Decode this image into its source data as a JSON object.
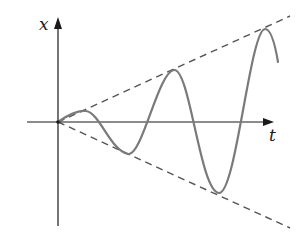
{
  "diagram": {
    "axes": {
      "vertical_label": "x",
      "horizontal_label": "t"
    },
    "envelope": {
      "style": "dashed",
      "upper": "x = +c·t",
      "lower": "x = -c·t"
    },
    "curve": {
      "description": "oscillation with linearly increasing amplitude, touching the dashed envelope lines at each extremum",
      "color": "#7a7a7a"
    },
    "colors": {
      "axis": "#1a1a1a",
      "dashed": "#555555",
      "curve": "#7a7a7a",
      "background": "#ffffff"
    }
  }
}
